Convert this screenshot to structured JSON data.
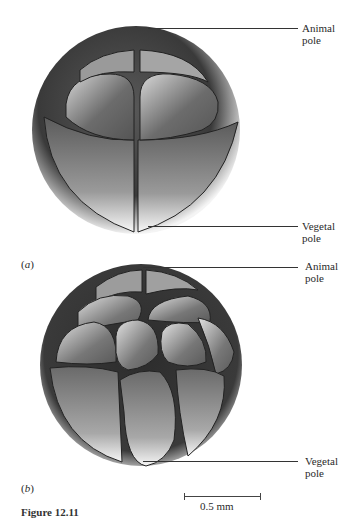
{
  "figure": {
    "caption_partial": "Figure 12.11",
    "panels": [
      {
        "id": "a",
        "letter": "a",
        "stage": "8-cell",
        "labels": {
          "top": "Animal\npole",
          "top_line1": "Animal",
          "top_line2": "pole",
          "bottom_line1": "Vegetal",
          "bottom_line2": "pole"
        }
      },
      {
        "id": "b",
        "letter": "b",
        "stage": "multi-cell",
        "labels": {
          "top_line1": "Animal",
          "top_line2": "pole",
          "bottom_line1": "Vegetal",
          "bottom_line2": "pole"
        }
      }
    ],
    "scale_bar": {
      "label": "0.5 mm"
    }
  }
}
